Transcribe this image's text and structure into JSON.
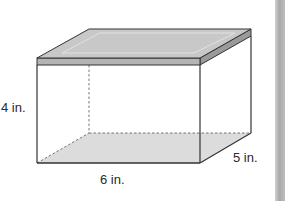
{
  "figure": {
    "type": "rectangular-prism-with-lid",
    "dimensions": {
      "height_label": "4 in.",
      "length_label": "6 in.",
      "width_label": "5 in."
    },
    "colors": {
      "edge": "#333333",
      "lid_top": "#c8c8c8",
      "lid_band_front": "#b4b4b4",
      "lid_band_side": "#9a9a9a",
      "lid_inset_highlight": "#e2e2e2",
      "base_shade": "#dcdcdc",
      "side_bar": "#b0b0b0"
    }
  }
}
